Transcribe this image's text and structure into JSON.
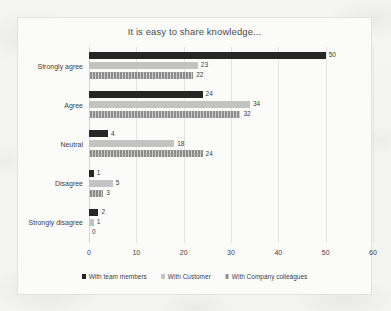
{
  "chart_data": {
    "type": "bar",
    "orientation": "horizontal",
    "title": "It is easy to share knowledge...",
    "xlabel": "",
    "ylabel": "",
    "xlim": [
      0,
      60
    ],
    "xticks": [
      0,
      10,
      20,
      30,
      40,
      50,
      60
    ],
    "xtick_labels": [
      "0",
      "10",
      "20",
      "30",
      "40",
      "50",
      "60"
    ],
    "grid": "vertical",
    "legend_position": "bottom",
    "categories": [
      "Strongly agree",
      "Agree",
      "Neutral",
      "Disagree",
      "Strongly disagree"
    ],
    "series": [
      {
        "name": "With team members",
        "color": "#262626",
        "values": [
          50,
          24,
          4,
          1,
          2
        ]
      },
      {
        "name": "With Customer",
        "color": "#c3c3c3",
        "values": [
          23,
          34,
          18,
          5,
          1
        ]
      },
      {
        "name": "With Company colleagues",
        "color": "#8d8d8d",
        "values": [
          22,
          32,
          24,
          3,
          0
        ]
      }
    ],
    "data_labels_shown": true
  }
}
